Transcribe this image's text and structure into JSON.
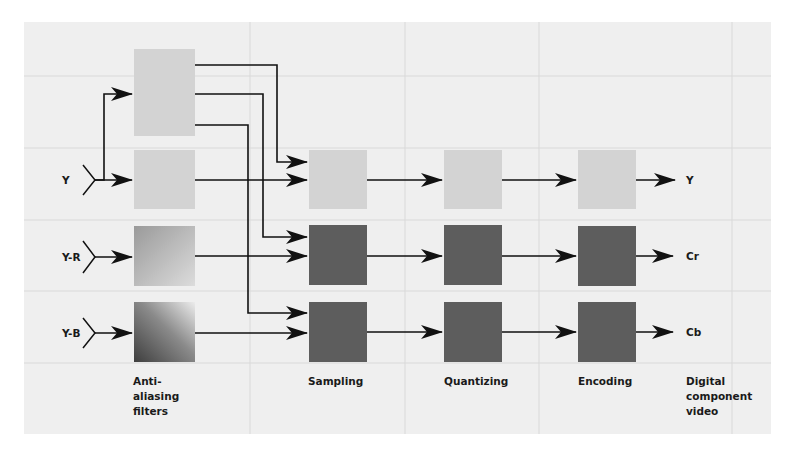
{
  "diagram": {
    "inputs": [
      {
        "id": "y",
        "label": "Y"
      },
      {
        "id": "yr",
        "label": "Y-R"
      },
      {
        "id": "yb",
        "label": "Y-B"
      }
    ],
    "outputs": [
      {
        "id": "y",
        "label": "Y"
      },
      {
        "id": "cr",
        "label": "Cr"
      },
      {
        "id": "cb",
        "label": "Cb"
      }
    ],
    "stages": [
      {
        "id": "antialiasing",
        "label_lines": [
          "Anti-",
          "aliasing",
          "filters"
        ]
      },
      {
        "id": "sampling",
        "label_lines": [
          "Sampling"
        ]
      },
      {
        "id": "quantizing",
        "label_lines": [
          "Quantizing"
        ]
      },
      {
        "id": "encoding",
        "label_lines": [
          "Encoding"
        ]
      },
      {
        "id": "output",
        "label_lines": [
          "Digital",
          "component",
          "video"
        ]
      }
    ],
    "colors": {
      "background": "#ffffff",
      "panel": "#efefef",
      "grid": "#d9d9d9",
      "box_light": "#d3d3d3",
      "box_dark": "#5d5d5d",
      "line": "#111111",
      "gradient_light": "#e8e8e8",
      "gradient_dark": "#4a4a4a"
    },
    "connections": [
      {
        "from": "input-y",
        "to": "antialias-clock"
      },
      {
        "from": "input-y",
        "to": "antialias-y"
      },
      {
        "from": "input-yr",
        "to": "antialias-yr"
      },
      {
        "from": "input-yb",
        "to": "antialias-yb"
      },
      {
        "from": "antialias-clock",
        "to": "sampling-y"
      },
      {
        "from": "antialias-clock",
        "to": "sampling-yr"
      },
      {
        "from": "antialias-clock",
        "to": "sampling-yb"
      },
      {
        "from": "antialias-y",
        "to": "sampling-y"
      },
      {
        "from": "antialias-yr",
        "to": "sampling-yr"
      },
      {
        "from": "antialias-yb",
        "to": "sampling-yb"
      },
      {
        "from": "sampling-y",
        "to": "quantizing-y"
      },
      {
        "from": "sampling-yr",
        "to": "quantizing-yr"
      },
      {
        "from": "sampling-yb",
        "to": "quantizing-yb"
      },
      {
        "from": "quantizing-y",
        "to": "encoding-y"
      },
      {
        "from": "quantizing-yr",
        "to": "encoding-yr"
      },
      {
        "from": "quantizing-yb",
        "to": "encoding-yb"
      },
      {
        "from": "encoding-y",
        "to": "output-y"
      },
      {
        "from": "encoding-yr",
        "to": "output-cr"
      },
      {
        "from": "encoding-yb",
        "to": "output-cb"
      }
    ]
  }
}
